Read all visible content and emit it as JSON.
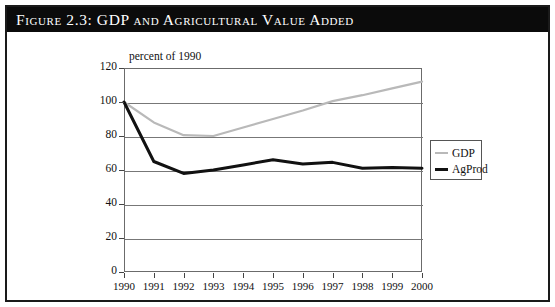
{
  "figure": {
    "title": "Figure 2.3:  GDP and Agricultural Value Added"
  },
  "chart_data": {
    "type": "line",
    "title": "Figure 2.3:  GDP and Agricultural Value Added",
    "subtitle": "percent of 1990",
    "xlabel": "",
    "ylabel": "percent of 1990",
    "x": [
      1990,
      1991,
      1992,
      1993,
      1994,
      1995,
      1996,
      1997,
      1998,
      1999,
      2000
    ],
    "categories": [
      "1990",
      "1991",
      "1992",
      "1993",
      "1994",
      "1995",
      "1996",
      "1997",
      "1998",
      "1999",
      "2000"
    ],
    "xlim": [
      1990,
      2000
    ],
    "ylim": [
      0,
      120
    ],
    "yticks": [
      0,
      20,
      40,
      60,
      80,
      100,
      120
    ],
    "ytick_labels": [
      "0",
      "20",
      "40",
      "60",
      "80",
      "100",
      "120"
    ],
    "grid": true,
    "legend_position": "right",
    "series": [
      {
        "name": "GDP",
        "color": "#b9b9b9",
        "values": [
          100,
          88,
          80.5,
          80,
          85,
          90,
          95,
          100.5,
          104,
          108,
          112
        ]
      },
      {
        "name": "AgProd",
        "color": "#111111",
        "values": [
          100,
          65,
          58,
          60,
          63,
          66,
          63.5,
          64.5,
          61,
          61.5,
          61
        ]
      }
    ]
  },
  "legend": {
    "items": [
      {
        "label": "GDP"
      },
      {
        "label": "AgProd"
      }
    ]
  }
}
